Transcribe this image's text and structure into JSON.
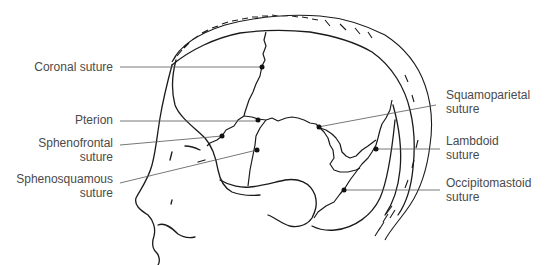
{
  "diagram": {
    "labels_left": [
      {
        "id": "coronal",
        "lines": [
          "Coronal suture"
        ]
      },
      {
        "id": "pterion",
        "lines": [
          "Pterion"
        ]
      },
      {
        "id": "sphenofrontal",
        "lines": [
          "Sphenofrontal",
          "suture"
        ]
      },
      {
        "id": "sphenosquamous",
        "lines": [
          "Sphenosquamous",
          "suture"
        ]
      }
    ],
    "labels_right": [
      {
        "id": "squamoparietal",
        "lines": [
          "Squamoparietal",
          "suture"
        ]
      },
      {
        "id": "lambdoid",
        "lines": [
          "Lambdoid",
          "suture"
        ]
      },
      {
        "id": "occipitomastoid",
        "lines": [
          "Occipitomastoid",
          "suture"
        ]
      }
    ],
    "colors": {
      "line": "#1a1a1a",
      "leader": "#555555",
      "text": "#4a4a4a",
      "background": "#ffffff"
    }
  }
}
